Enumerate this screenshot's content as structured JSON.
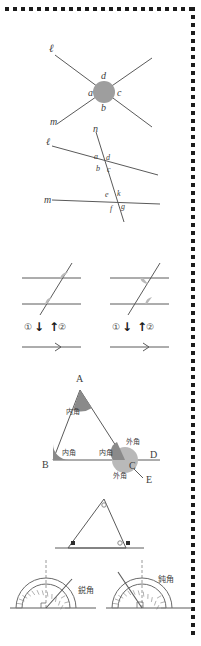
{
  "page": {
    "border_style": "dotted-square-frame"
  },
  "figures": [
    {
      "id": "fig-vertical-angles",
      "name": "two-crossing-lines-vertical-angles",
      "line_labels": [
        "ℓ",
        "m"
      ],
      "angle_labels": [
        "a",
        "b",
        "c",
        "d"
      ],
      "shaded_region": "circle-at-intersection"
    },
    {
      "id": "fig-transversal",
      "name": "two-lines-cut-by-transversal",
      "line_labels": [
        "ℓ",
        "m",
        "n"
      ],
      "upper_angle_labels": [
        "a",
        "d",
        "b",
        "c"
      ],
      "lower_angle_labels": [
        "e",
        "k",
        "f",
        "g"
      ]
    },
    {
      "id": "fig-corresponding-left",
      "name": "corresponding-angles-pair",
      "marker_labels": [
        "①",
        "②"
      ],
      "arrow_down": "↓",
      "arrow_up": "↑"
    },
    {
      "id": "fig-corresponding-right",
      "name": "alternate-angles-pair",
      "marker_labels": [
        "①",
        "②"
      ],
      "arrow_down": "↓",
      "arrow_up": "↑"
    },
    {
      "id": "fig-triangle-interior-exterior",
      "name": "triangle-interior-exterior-angles",
      "vertex_labels": [
        "A",
        "B",
        "C",
        "D",
        "E"
      ],
      "interior_label": "内角",
      "exterior_label": "外角",
      "interior_count": 3,
      "exterior_count": 2
    },
    {
      "id": "fig-triangle-marked",
      "name": "triangle-with-angle-marks",
      "vertex_marks": [
        "○",
        "●",
        "■"
      ]
    },
    {
      "id": "fig-protractor-acute",
      "name": "protractor-acute-angle",
      "label": "鋭角"
    },
    {
      "id": "fig-protractor-obtuse",
      "name": "protractor-obtuse-angle",
      "label": "鈍角"
    }
  ],
  "text": {
    "ell": "ℓ",
    "m": "m",
    "n": "n",
    "a": "a",
    "b": "b",
    "c": "c",
    "d": "d",
    "e": "e",
    "f": "f",
    "g": "g",
    "k": "k",
    "A": "A",
    "B": "B",
    "C": "C",
    "D": "D",
    "E": "E",
    "one": "①",
    "two": "②",
    "down": "↓",
    "up": "↑",
    "naikaku": "内角",
    "gaikaku": "外角",
    "eikaku": "鋭角",
    "donkaku": "鈍角"
  },
  "colors": {
    "ink": "#3d3d3d",
    "line": "#5a5a5a",
    "shade": "#9e9e9e",
    "shade_light": "#b9b9b9",
    "frame": "#1c1c1c",
    "background": "#ffffff"
  }
}
